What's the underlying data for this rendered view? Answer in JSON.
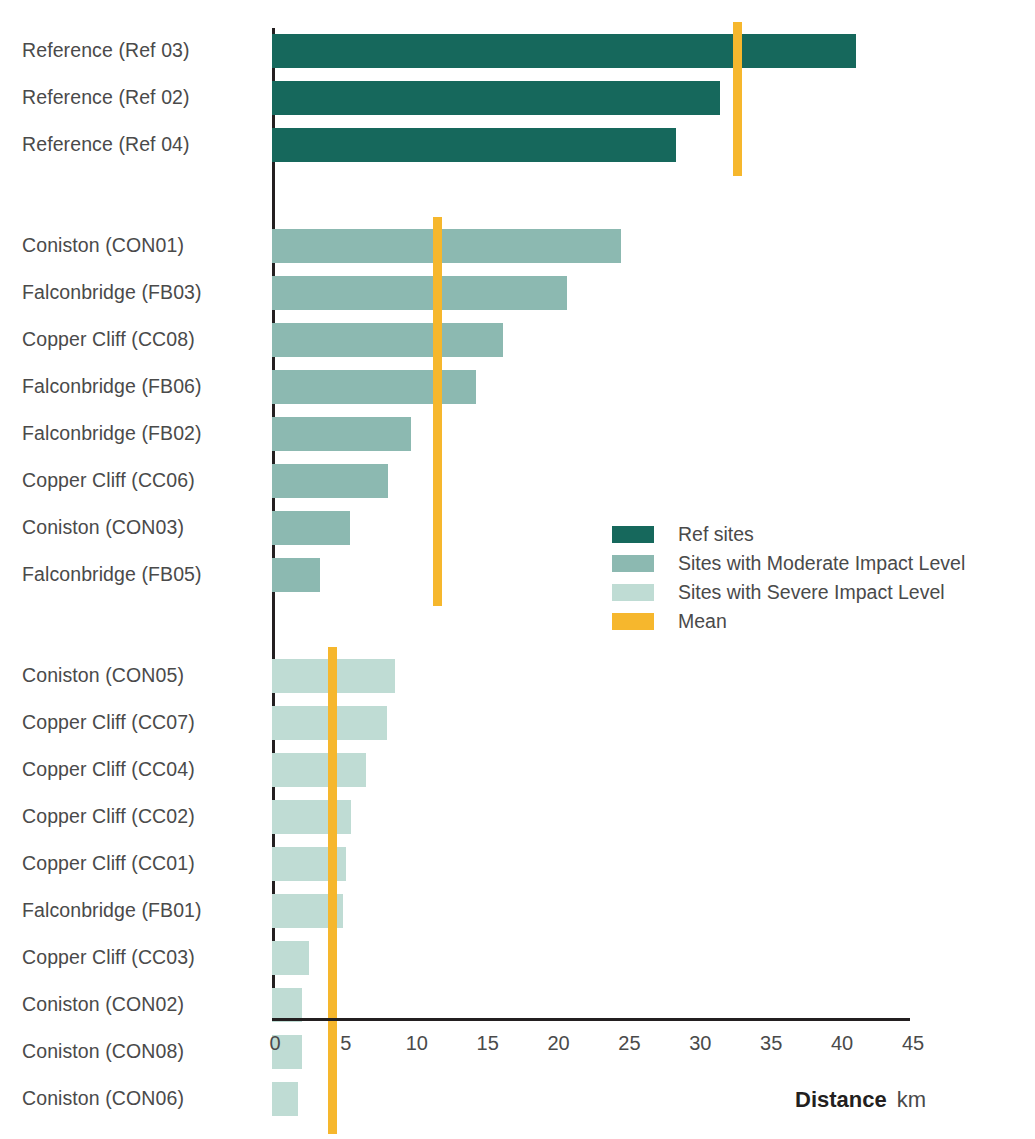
{
  "chart_data": {
    "type": "bar",
    "orientation": "horizontal",
    "title": "",
    "xlabel": "Distance",
    "xunit": "km",
    "ylabel": "",
    "xlim": [
      0,
      45
    ],
    "xticks": [
      0,
      5,
      10,
      15,
      20,
      25,
      30,
      35,
      40,
      45
    ],
    "grid": false,
    "legend_position": "inside-right",
    "colors": {
      "ref": "#16685c",
      "moderate": "#8cb9b1",
      "severe": "#bfdcd4",
      "mean": "#f6b72d",
      "axis": "#231f20",
      "text": "#4a4a4a",
      "background": "#ffffff"
    },
    "groups": [
      {
        "name": "Ref sites",
        "series_key": "ref",
        "mean": 32.8,
        "categories": [
          "Reference (Ref 03)",
          "Reference (Ref 02)",
          "Reference (Ref 04)"
        ],
        "values": [
          41.2,
          31.6,
          28.5
        ]
      },
      {
        "name": "Sites with Moderate Impact Level",
        "series_key": "moderate",
        "mean": 11.7,
        "categories": [
          "Coniston (CON01)",
          "Falconbridge (FB03)",
          "Copper Cliff (CC08)",
          "Falconbridge (FB06)",
          "Falconbridge (FB02)",
          "Copper Cliff (CC06)",
          "Coniston (CON03)",
          "Falconbridge (FB05)"
        ],
        "values": [
          24.6,
          20.8,
          16.3,
          14.4,
          9.8,
          8.2,
          5.5,
          3.4
        ]
      },
      {
        "name": "Sites with Severe Impact Level",
        "series_key": "severe",
        "mean": 4.3,
        "categories": [
          "Coniston (CON05)",
          "Copper Cliff (CC07)",
          "Copper Cliff (CC04)",
          "Copper Cliff (CC02)",
          "Copper Cliff (CC01)",
          "Falconbridge (FB01)",
          "Copper Cliff (CC03)",
          "Coniston (CON02)",
          "Coniston (CON08)",
          "Coniston (CON06)"
        ],
        "values": [
          8.7,
          8.1,
          6.6,
          5.6,
          5.2,
          5.0,
          2.6,
          2.1,
          2.1,
          1.8
        ]
      }
    ],
    "legend": [
      {
        "label": "Ref sites",
        "swatch": "ref"
      },
      {
        "label": "Sites with Moderate Impact Level",
        "swatch": "moderate"
      },
      {
        "label": "Sites with Severe Impact Level",
        "swatch": "severe"
      },
      {
        "label": "Mean",
        "swatch": "mean"
      }
    ]
  }
}
